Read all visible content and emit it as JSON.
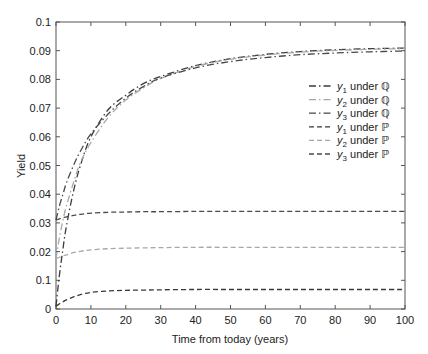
{
  "chart_data": {
    "type": "line",
    "title": "",
    "xlabel": "Time from today (years)",
    "ylabel": "Yield",
    "xlim": [
      0,
      100
    ],
    "ylim": [
      0,
      0.1
    ],
    "xticks": [
      0,
      10,
      20,
      30,
      40,
      50,
      60,
      70,
      80,
      90,
      100
    ],
    "xtick_labels": [
      "0",
      "10",
      "20",
      "30",
      "40",
      "50",
      "60",
      "70",
      "80",
      "90",
      "100"
    ],
    "yticks": [
      0,
      0.01,
      0.02,
      0.03,
      0.04,
      0.05,
      0.06,
      0.07,
      0.08,
      0.09,
      0.1
    ],
    "ytick_labels": [
      "0",
      "0.1",
      "0.02",
      "0.03",
      "0.04",
      "0.05",
      "0.06",
      "0.07",
      "0.08",
      "0.09",
      "0.1"
    ],
    "grid": false,
    "legend_position": "upper right",
    "x": [
      0,
      1,
      2,
      3,
      5,
      7,
      10,
      15,
      20,
      25,
      30,
      40,
      50,
      60,
      70,
      80,
      90,
      100
    ],
    "series": [
      {
        "name": "y1 under Q",
        "label_var": "y",
        "label_sub": "1",
        "label_rest": " under ",
        "label_measure": "ℚ",
        "style": "dashdot",
        "color": "#3a3a3a",
        "values": [
          0.001,
          0.012,
          0.021,
          0.029,
          0.041,
          0.05,
          0.06,
          0.0695,
          0.0745,
          0.0785,
          0.081,
          0.0848,
          0.0872,
          0.0887,
          0.0897,
          0.0903,
          0.0907,
          0.0909
        ]
      },
      {
        "name": "y2 under Q",
        "label_var": "y",
        "label_sub": "2",
        "label_rest": " under ",
        "label_measure": "ℚ",
        "style": "dashdot",
        "color": "#a8a8a8",
        "values": [
          0.0175,
          0.025,
          0.031,
          0.036,
          0.044,
          0.051,
          0.058,
          0.0668,
          0.0728,
          0.077,
          0.0803,
          0.0845,
          0.087,
          0.0885,
          0.0895,
          0.0901,
          0.0905,
          0.0907
        ]
      },
      {
        "name": "y3 under Q",
        "label_var": "y",
        "label_sub": "3",
        "label_rest": " under ",
        "label_measure": "ℚ",
        "style": "dashdot",
        "color": "#4a4a4a",
        "values": [
          0.031,
          0.036,
          0.04,
          0.044,
          0.05,
          0.055,
          0.061,
          0.068,
          0.0735,
          0.0775,
          0.0805,
          0.084,
          0.0862,
          0.0876,
          0.0886,
          0.0892,
          0.0896,
          0.0899
        ]
      },
      {
        "name": "y1 under P",
        "label_var": "y",
        "label_sub": "1",
        "label_rest": " under ",
        "label_measure": "ℙ",
        "style": "dashed",
        "color": "#3a3a3a",
        "values": [
          0.001,
          0.0018,
          0.0025,
          0.0032,
          0.0042,
          0.005,
          0.0058,
          0.0063,
          0.0065,
          0.0066,
          0.0067,
          0.0068,
          0.0068,
          0.0068,
          0.0068,
          0.0068,
          0.0068,
          0.0068
        ]
      },
      {
        "name": "y2 under P",
        "label_var": "y",
        "label_sub": "2",
        "label_rest": " under ",
        "label_measure": "ℙ",
        "style": "dashed",
        "color": "#a8a8a8",
        "values": [
          0.0175,
          0.018,
          0.0185,
          0.0189,
          0.0196,
          0.0201,
          0.0206,
          0.021,
          0.0212,
          0.0213,
          0.0214,
          0.0215,
          0.0215,
          0.0215,
          0.0215,
          0.0215,
          0.0215,
          0.0215
        ]
      },
      {
        "name": "y3 under P",
        "label_var": "y",
        "label_sub": "3",
        "label_rest": " under ",
        "label_measure": "ℙ",
        "style": "dashed",
        "color": "#4a4a4a",
        "values": [
          0.031,
          0.0314,
          0.0318,
          0.0321,
          0.0326,
          0.033,
          0.0334,
          0.0337,
          0.0338,
          0.0339,
          0.0339,
          0.034,
          0.034,
          0.034,
          0.034,
          0.034,
          0.034,
          0.034
        ]
      }
    ]
  },
  "layout": {
    "plot_left": 56,
    "plot_right": 405,
    "plot_top": 22,
    "plot_bottom": 309,
    "axis_color": "#555555"
  }
}
